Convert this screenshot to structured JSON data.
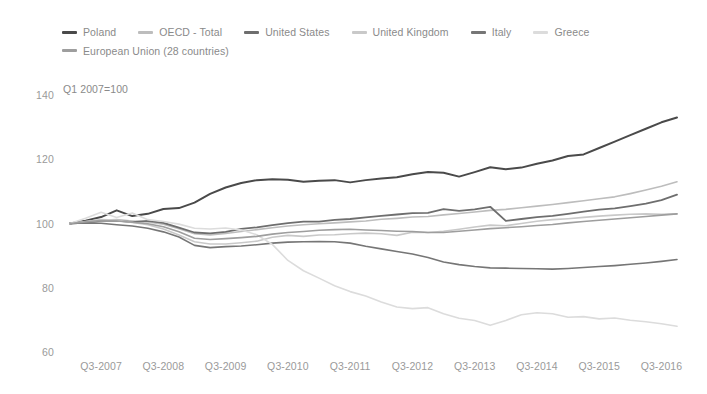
{
  "chart_data": {
    "type": "line",
    "title": "",
    "subtitle": "Q1 2007=100",
    "xlabel": "",
    "ylabel": "",
    "ylim": [
      60,
      140
    ],
    "yticks": [
      140,
      120,
      100,
      80,
      60
    ],
    "grid": false,
    "legend_position": "top-left",
    "x": [
      "Q1-2007",
      "Q2-2007",
      "Q3-2007",
      "Q4-2007",
      "Q1-2008",
      "Q2-2008",
      "Q3-2008",
      "Q4-2008",
      "Q1-2009",
      "Q2-2009",
      "Q3-2009",
      "Q4-2009",
      "Q1-2010",
      "Q2-2010",
      "Q3-2010",
      "Q4-2010",
      "Q1-2011",
      "Q2-2011",
      "Q3-2011",
      "Q4-2011",
      "Q1-2012",
      "Q2-2012",
      "Q3-2012",
      "Q4-2012",
      "Q1-2013",
      "Q2-2013",
      "Q3-2013",
      "Q4-2013",
      "Q1-2014",
      "Q2-2014",
      "Q3-2014",
      "Q4-2014",
      "Q1-2015",
      "Q2-2015",
      "Q3-2015",
      "Q4-2015",
      "Q1-2016",
      "Q2-2016",
      "Q3-2016",
      "Q4-2016"
    ],
    "xticks": [
      "Q3-2007",
      "Q3-2008",
      "Q3-2009",
      "Q3-2010",
      "Q3-2011",
      "Q3-2012",
      "Q3-2013",
      "Q3-2014",
      "Q3-2015",
      "Q3-2016"
    ],
    "series": [
      {
        "name": "Poland",
        "color": "#4a4a4a",
        "width": 2.0,
        "values": [
          100.0,
          100.9,
          102.0,
          104.1,
          102.3,
          103.0,
          104.5,
          104.8,
          106.5,
          109.2,
          111.2,
          112.6,
          113.5,
          113.8,
          113.6,
          113.0,
          113.3,
          113.5,
          112.8,
          113.5,
          114.0,
          114.4,
          115.3,
          116.0,
          115.8,
          114.6,
          116.0,
          117.5,
          116.9,
          117.4,
          118.6,
          119.6,
          121.0,
          121.5,
          123.5,
          125.5,
          127.5,
          129.5,
          131.5,
          133.0
        ]
      },
      {
        "name": "OECD - Total",
        "color": "#bdbdbd",
        "width": 1.6,
        "values": [
          100.0,
          100.5,
          101.0,
          101.2,
          100.8,
          100.5,
          99.8,
          98.4,
          96.8,
          96.4,
          96.9,
          97.5,
          98.1,
          98.7,
          99.2,
          99.6,
          99.9,
          100.2,
          100.5,
          100.8,
          101.3,
          101.6,
          102.0,
          102.2,
          102.7,
          103.1,
          103.6,
          104.1,
          104.4,
          104.9,
          105.4,
          105.9,
          106.5,
          107.1,
          107.7,
          108.3,
          109.3,
          110.4,
          111.6,
          113.0
        ]
      },
      {
        "name": "United States",
        "color": "#6e6e6e",
        "width": 1.8,
        "values": [
          100.0,
          100.3,
          100.8,
          100.9,
          100.4,
          100.8,
          100.2,
          98.7,
          97.2,
          96.9,
          97.4,
          98.3,
          98.8,
          99.5,
          100.1,
          100.6,
          100.6,
          101.1,
          101.4,
          101.9,
          102.4,
          102.8,
          103.2,
          103.3,
          104.5,
          103.9,
          104.4,
          105.2,
          100.8,
          101.4,
          102.0,
          102.4,
          103.0,
          103.7,
          104.3,
          104.7,
          105.4,
          106.2,
          107.3,
          109.0
        ]
      },
      {
        "name": "United Kingdom",
        "color": "#c9c9c9",
        "width": 1.6,
        "values": [
          100.0,
          100.6,
          101.2,
          101.1,
          100.3,
          99.6,
          98.3,
          96.4,
          94.3,
          93.6,
          93.6,
          94.0,
          94.5,
          95.7,
          96.3,
          96.0,
          96.4,
          96.5,
          96.8,
          97.0,
          96.8,
          96.3,
          97.3,
          97.2,
          97.6,
          98.2,
          98.9,
          99.5,
          99.3,
          100.0,
          100.7,
          101.2,
          101.5,
          101.9,
          102.3,
          102.6,
          102.9,
          103.0,
          102.9,
          103.0
        ]
      },
      {
        "name": "Italy",
        "color": "#767676",
        "width": 1.6,
        "values": [
          100.0,
          100.2,
          100.1,
          99.6,
          99.2,
          98.5,
          97.4,
          95.8,
          93.2,
          92.5,
          92.8,
          93.0,
          93.4,
          93.9,
          94.2,
          94.3,
          94.4,
          94.3,
          93.9,
          92.9,
          92.1,
          91.3,
          90.5,
          89.4,
          88.0,
          87.2,
          86.6,
          86.2,
          86.1,
          86.0,
          85.9,
          85.8,
          86.0,
          86.3,
          86.6,
          86.9,
          87.3,
          87.7,
          88.2,
          88.8
        ]
      },
      {
        "name": "Greece",
        "color": "#dcdcdc",
        "width": 1.6,
        "values": [
          100.0,
          101.6,
          103.5,
          101.9,
          103.3,
          101.2,
          100.6,
          99.8,
          98.5,
          98.3,
          98.6,
          98.0,
          96.5,
          93.5,
          88.5,
          85.3,
          83.0,
          80.6,
          78.8,
          77.4,
          75.6,
          74.0,
          73.5,
          73.8,
          71.9,
          70.5,
          69.8,
          68.3,
          69.8,
          71.6,
          72.2,
          71.9,
          70.8,
          71.0,
          70.3,
          70.6,
          69.9,
          69.4,
          68.8,
          68.0
        ]
      },
      {
        "name": "European Union (28 countries)",
        "color": "#9e9e9e",
        "width": 1.6,
        "values": [
          100.0,
          100.5,
          100.9,
          100.8,
          100.4,
          99.9,
          99.0,
          97.4,
          95.4,
          95.0,
          95.3,
          95.6,
          96.0,
          96.7,
          97.2,
          97.5,
          97.9,
          98.1,
          98.2,
          98.0,
          97.8,
          97.6,
          97.5,
          97.2,
          97.2,
          97.6,
          98.0,
          98.4,
          98.7,
          99.0,
          99.4,
          99.7,
          100.2,
          100.6,
          101.0,
          101.4,
          101.8,
          102.2,
          102.6,
          103.0
        ]
      }
    ]
  },
  "legend": {
    "items": [
      {
        "label": "Poland"
      },
      {
        "label": "OECD - Total"
      },
      {
        "label": "United States"
      },
      {
        "label": "United Kingdom"
      },
      {
        "label": "Italy"
      },
      {
        "label": "Greece"
      },
      {
        "label": "European Union (28 countries)"
      }
    ]
  }
}
